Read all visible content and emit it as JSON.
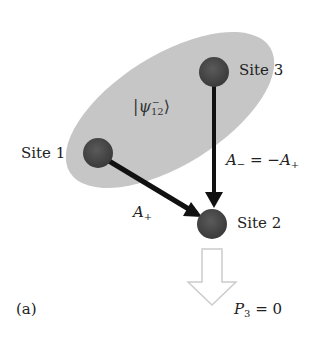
{
  "diagram": {
    "panel_label": "(a)",
    "entangled_state": {
      "symbol": "ψ",
      "subscript": "12",
      "sup": "−",
      "ket_left": "|",
      "ket_right": "⟩"
    },
    "sites": [
      {
        "id": "site1",
        "label": "Site 1",
        "cx": 98,
        "cy": 153
      },
      {
        "id": "site2",
        "label": "Site 2",
        "cx": 214,
        "cy": 72
      },
      {
        "id": "site3",
        "label": "Site 3",
        "cx": 212,
        "cy": 223
      }
    ],
    "arrows": [
      {
        "from": "site1",
        "to": "site3",
        "label_main": "A",
        "label_sub": "+"
      },
      {
        "from": "site2",
        "to": "site3",
        "label_main": "A",
        "label_sub": "−",
        "label_eq": " = −A",
        "label_eq_sub": "+"
      }
    ],
    "output": {
      "label_main": "P",
      "label_sub": "3",
      "label_eq": " = 0"
    },
    "colors": {
      "ellipse": "#c4c4c4",
      "site": "#4a4a4a",
      "arrow": "#111111",
      "output_arrow": "#cfcfcf"
    }
  }
}
